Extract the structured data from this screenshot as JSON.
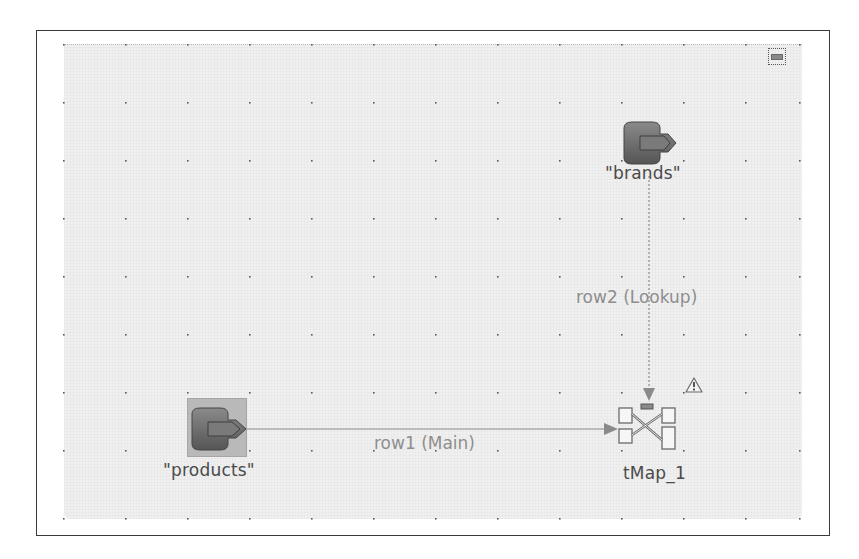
{
  "diagram": {
    "nodes": [
      {
        "id": "brands",
        "label": "\"brands\"",
        "type": "input-component",
        "icon": "db-input-icon",
        "selected": false
      },
      {
        "id": "products",
        "label": "\"products\"",
        "type": "input-component",
        "icon": "db-input-icon",
        "selected": true
      },
      {
        "id": "tMap_1",
        "label": "tMap_1",
        "type": "tMap",
        "icon": "tmap-icon",
        "warning": true
      }
    ],
    "links": [
      {
        "from": "products",
        "to": "tMap_1",
        "label": "row1 (Main)",
        "style": "solid"
      },
      {
        "from": "brands",
        "to": "tMap_1",
        "label": "row2 (Lookup)",
        "style": "dotted"
      }
    ]
  },
  "controls": {
    "minimize_icon": "minimize-icon",
    "warning_icon": "warning-icon"
  },
  "colors": {
    "canvas_bg": "#f0f0f0",
    "frame_border": "#3a3a3a",
    "node_label": "#4a4a4a",
    "link_label": "#8e8e8e",
    "link_line": "#8a8a8a",
    "icon_fill": "#6e6e6e",
    "selection_bg": "#b9b9b9"
  }
}
